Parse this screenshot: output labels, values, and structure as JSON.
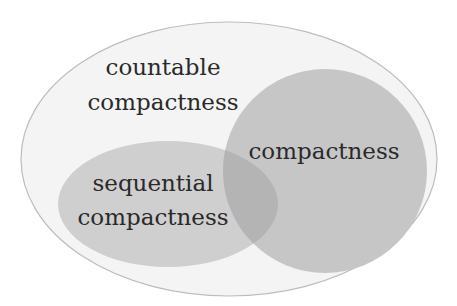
{
  "diagram": {
    "type": "venn",
    "sets": {
      "outer": {
        "label_line1": "countable",
        "label_line2": "compactness",
        "fill": "#f4f4f4",
        "stroke": "#bdbdbd"
      },
      "compactness": {
        "label": "compactness",
        "fill": "#c6c6c6"
      },
      "sequential": {
        "label_line1": "sequential",
        "label_line2": "compactness",
        "fill": "#cfcfcf"
      },
      "overlap_fill": "#b4b4b4"
    }
  }
}
